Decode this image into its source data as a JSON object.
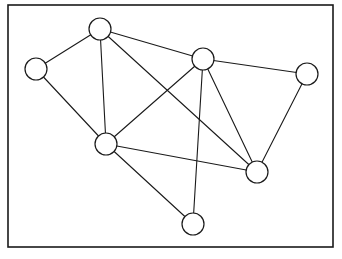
{
  "figure": {
    "kind": "undirected-graph-diagram",
    "background_color": "#ffffff",
    "stroke_color": "#1a1a1a",
    "node_fill_color": "#ffffff",
    "node_count": 7,
    "edge_count": 12
  },
  "frame": {
    "x": 8,
    "y": 5,
    "width": 325,
    "height": 242,
    "stroke_width": 1.6
  },
  "nodes": [
    {
      "id": "A",
      "cx": 100,
      "cy": 29,
      "r": 11,
      "degree": 4
    },
    {
      "id": "B",
      "cx": 36,
      "cy": 69,
      "r": 11,
      "degree": 2
    },
    {
      "id": "C",
      "cx": 203,
      "cy": 59,
      "r": 11,
      "degree": 5
    },
    {
      "id": "D",
      "cx": 307,
      "cy": 74,
      "r": 11,
      "degree": 2
    },
    {
      "id": "E",
      "cx": 106,
      "cy": 144,
      "r": 11,
      "degree": 5
    },
    {
      "id": "F",
      "cx": 257,
      "cy": 172,
      "r": 11,
      "degree": 4
    },
    {
      "id": "G",
      "cx": 193,
      "cy": 224,
      "r": 11,
      "degree": 2
    }
  ],
  "edges": [
    {
      "from": "A",
      "to": "B",
      "x1": 100,
      "y1": 29,
      "x2": 36,
      "y2": 69
    },
    {
      "from": "A",
      "to": "C",
      "x1": 100,
      "y1": 29,
      "x2": 203,
      "y2": 59
    },
    {
      "from": "A",
      "to": "E",
      "x1": 100,
      "y1": 29,
      "x2": 106,
      "y2": 144
    },
    {
      "from": "A",
      "to": "F",
      "x1": 100,
      "y1": 29,
      "x2": 257,
      "y2": 172
    },
    {
      "from": "B",
      "to": "E",
      "x1": 36,
      "y1": 69,
      "x2": 106,
      "y2": 144
    },
    {
      "from": "C",
      "to": "D",
      "x1": 203,
      "y1": 59,
      "x2": 307,
      "y2": 74
    },
    {
      "from": "C",
      "to": "E",
      "x1": 203,
      "y1": 59,
      "x2": 106,
      "y2": 144
    },
    {
      "from": "C",
      "to": "F",
      "x1": 203,
      "y1": 59,
      "x2": 257,
      "y2": 172
    },
    {
      "from": "C",
      "to": "G",
      "x1": 203,
      "y1": 59,
      "x2": 193,
      "y2": 224
    },
    {
      "from": "D",
      "to": "F",
      "x1": 307,
      "y1": 74,
      "x2": 257,
      "y2": 172
    },
    {
      "from": "E",
      "to": "F",
      "x1": 106,
      "y1": 144,
      "x2": 257,
      "y2": 172
    },
    {
      "from": "E",
      "to": "G",
      "x1": 106,
      "y1": 144,
      "x2": 193,
      "y2": 224
    }
  ]
}
